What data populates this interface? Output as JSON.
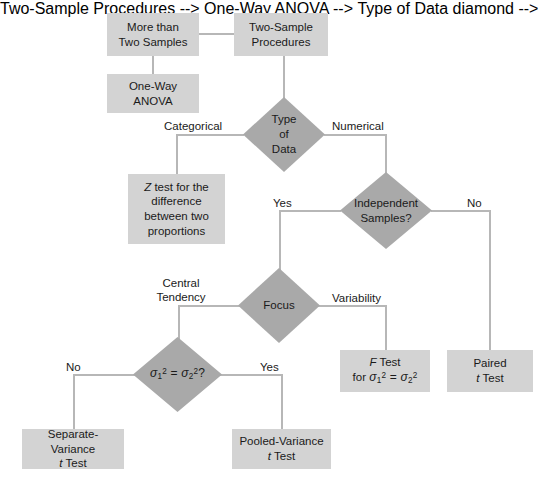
{
  "diagram": {
    "colors": {
      "box_fill": "#d3d3d3",
      "diamond_fill": "#a9a9a9",
      "connector": "#b7b7b7",
      "text": "#1a1a1a",
      "background": "#ffffff"
    },
    "nodes": {
      "more_than_two_samples": {
        "line1": "More than",
        "line2": "Two Samples"
      },
      "two_sample_procedures": {
        "line1": "Two-Sample",
        "line2": "Procedures"
      },
      "one_way_anova": {
        "line1": "One-Way",
        "line2": "ANOVA"
      },
      "type_of_data": {
        "line1": "Type",
        "line2": "of",
        "line3": "Data"
      },
      "z_test": {
        "line1": "Z test for the",
        "line2": "difference",
        "line3": "between two",
        "line4": "proportions",
        "italic_part": "Z"
      },
      "independent_samples": {
        "line1": "Independent",
        "line2": "Samples?"
      },
      "focus": {
        "line1": "Focus"
      },
      "variance_equal": {
        "formula": "σ1² = σ2²?",
        "sigma": "σ",
        "sub1": "1",
        "sub2": "2",
        "sup": "2",
        "equals": "=",
        "question": "?"
      },
      "f_test": {
        "line1": "F Test",
        "line2": "for σ1² = σ2²",
        "italic_part": "F",
        "for_word": "for"
      },
      "paired_t_test": {
        "line1": "Paired",
        "line2": "t Test",
        "italic_part": "t"
      },
      "separate_variance": {
        "line1": "Separate-Variance",
        "line2": "t Test",
        "italic_part": "t"
      },
      "pooled_variance": {
        "line1": "Pooled-Variance",
        "line2": "t Test",
        "italic_part": "t"
      }
    },
    "edge_labels": {
      "categorical": "Categorical",
      "numerical": "Numerical",
      "independent_yes": "Yes",
      "independent_no": "No",
      "central_tendency_l1": "Central",
      "central_tendency_l2": "Tendency",
      "variability": "Variability",
      "variance_no": "No",
      "variance_yes": "Yes"
    }
  }
}
